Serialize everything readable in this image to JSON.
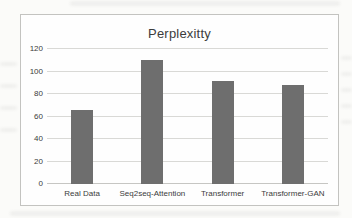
{
  "chart_data": {
    "type": "bar",
    "title": "Perplexitty",
    "categories": [
      "Real Data",
      "Seq2seq-Attention",
      "Transformer",
      "Transformer-GAN"
    ],
    "values": [
      66,
      110,
      92,
      88
    ],
    "xlabel": "",
    "ylabel": "",
    "ylim": [
      0,
      120
    ],
    "yticks": [
      0,
      20,
      40,
      60,
      80,
      100,
      120
    ],
    "grid": true,
    "legend_position": "none",
    "bar_color": "#6e6e6e",
    "gridline_color": "#d9d9d6",
    "axis_line_color": "#c6c6c3",
    "frame_border_color": "#c3c3c0",
    "text_color": "#3c3c3c",
    "background_color": "#fbfbf9"
  }
}
